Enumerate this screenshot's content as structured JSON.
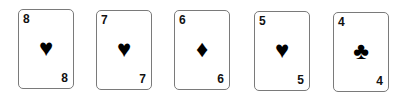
{
  "cards": [
    {
      "rank": "8",
      "suit": "♥",
      "suit_name": "hearts"
    },
    {
      "rank": "7",
      "suit": "♥",
      "suit_name": "hearts"
    },
    {
      "rank": "6",
      "suit": "♦",
      "suit_name": "diamonds"
    },
    {
      "rank": "5",
      "suit": "♥",
      "suit_name": "hearts"
    },
    {
      "rank": "4",
      "suit": "♣",
      "suit_name": "clubs"
    }
  ]
}
